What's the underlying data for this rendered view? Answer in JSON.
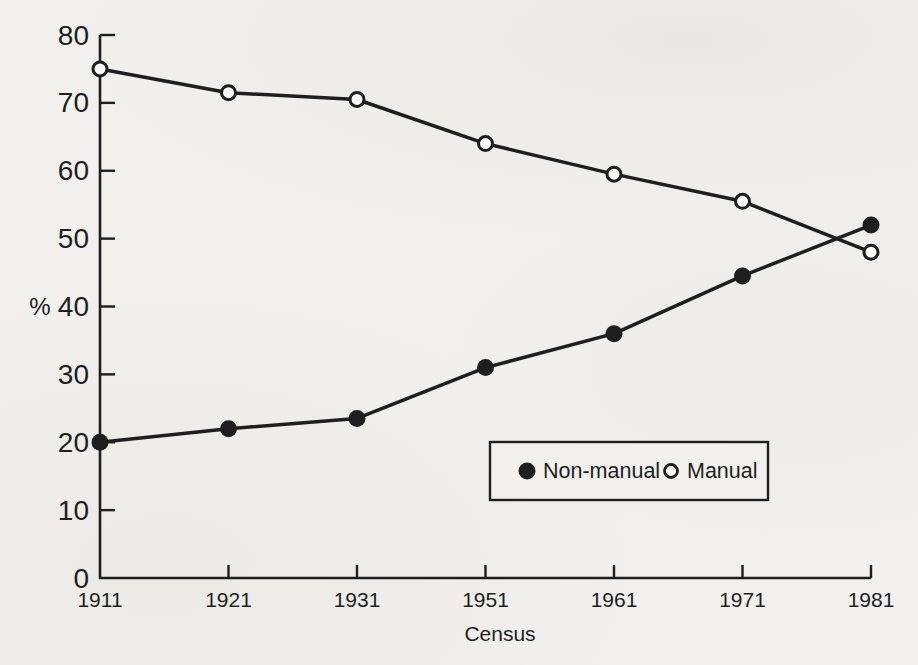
{
  "page": {
    "paper_color": "#f1f0ec",
    "ink_color": "#1e1e1e"
  },
  "chart_data": {
    "type": "line",
    "categories": [
      "1911",
      "1921",
      "1931",
      "1951",
      "1961",
      "1971",
      "1981"
    ],
    "series": [
      {
        "name": "Non-manual",
        "marker": "filled-circle",
        "color": "#1e1e1e",
        "values": [
          20,
          22,
          23.5,
          31,
          36,
          44.5,
          52
        ]
      },
      {
        "name": "Manual",
        "marker": "open-circle",
        "color": "#1e1e1e",
        "values": [
          75,
          71.5,
          70.5,
          64,
          59.5,
          55.5,
          48
        ]
      }
    ],
    "xlabel": "Census",
    "ylabel": "%",
    "ylim": [
      0,
      80
    ],
    "yticks": [
      0,
      10,
      20,
      30,
      40,
      50,
      60,
      70,
      80
    ],
    "grid": false,
    "legend_position": "inside-bottom-right",
    "legend_labels": [
      "Non-manual",
      "Manual"
    ]
  }
}
